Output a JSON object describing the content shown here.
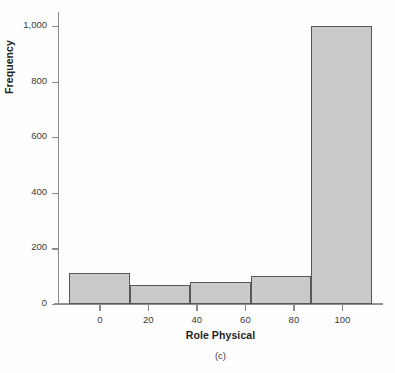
{
  "chart_data": {
    "type": "bar",
    "title": "",
    "subtitle": "",
    "caption": "(c)",
    "xlabel": "Role Physical",
    "ylabel": "Frequency",
    "grid": false,
    "legend": null,
    "xlim": [
      -17,
      117
    ],
    "ylim": [
      0,
      1050
    ],
    "ytick_labels": [
      "0",
      "200",
      "400",
      "600",
      "800",
      "1,000"
    ],
    "ytick_values": [
      0,
      200,
      400,
      600,
      800,
      1000
    ],
    "xtick_labels": [
      "0",
      "20",
      "40",
      "60",
      "80",
      "100"
    ],
    "xtick_values": [
      0,
      20,
      40,
      60,
      80,
      100
    ],
    "bin_edges": [
      -12.5,
      12.5,
      37.5,
      62.5,
      87.5,
      112.5
    ],
    "categories": [
      "-12.5 to 12.5",
      "12.5 to 37.5",
      "37.5 to 62.5",
      "62.5 to 87.5",
      "87.5 to 112.5"
    ],
    "values": [
      112,
      67,
      80,
      102,
      1000
    ],
    "bar_fill_color": "#cacaca",
    "bar_edge_color": "#585858",
    "axis_color": "#8a8a8a"
  }
}
